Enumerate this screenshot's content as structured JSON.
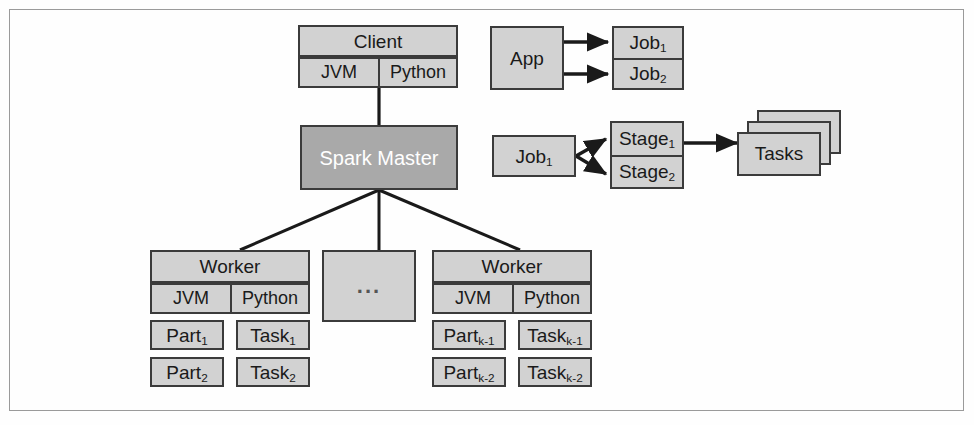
{
  "figure": {
    "colors": {
      "box_fill": "#d2d2d2",
      "box_fill_dark": "#a9a9a9",
      "box_stroke": "#3b3b3b",
      "frame_stroke": "#9a9a9a",
      "background": "#fefefe",
      "dark_box_text": "#ffffff"
    }
  },
  "cluster": {
    "client": {
      "title": "Client",
      "runtimes": [
        "JVM",
        "Python"
      ]
    },
    "master": {
      "label": "Spark Master"
    },
    "ellipsis": {
      "label": "..."
    },
    "workers": [
      {
        "title": "Worker",
        "runtimes": [
          "JVM",
          "Python"
        ],
        "slots": [
          {
            "partition": "Part",
            "partition_sub": "1",
            "task": "Task",
            "task_sub": "1"
          },
          {
            "partition": "Part",
            "partition_sub": "2",
            "task": "Task",
            "task_sub": "2"
          }
        ]
      },
      {
        "title": "Worker",
        "runtimes": [
          "JVM",
          "Python"
        ],
        "slots": [
          {
            "partition": "Part",
            "partition_sub": "k-1",
            "task": "Task",
            "task_sub": "k-1"
          },
          {
            "partition": "Part",
            "partition_sub": "k-2",
            "task": "Task",
            "task_sub": "k-2"
          }
        ]
      }
    ]
  },
  "execution": {
    "app": {
      "label": "App"
    },
    "jobs": [
      {
        "label": "Job",
        "sub": "1"
      },
      {
        "label": "Job",
        "sub": "2"
      }
    ],
    "job_source": {
      "label": "Job",
      "sub": "1"
    },
    "stages": [
      {
        "label": "Stage",
        "sub": "1"
      },
      {
        "label": "Stage",
        "sub": "2"
      }
    ],
    "tasks": {
      "label": "Tasks",
      "stack_count": 3
    }
  }
}
